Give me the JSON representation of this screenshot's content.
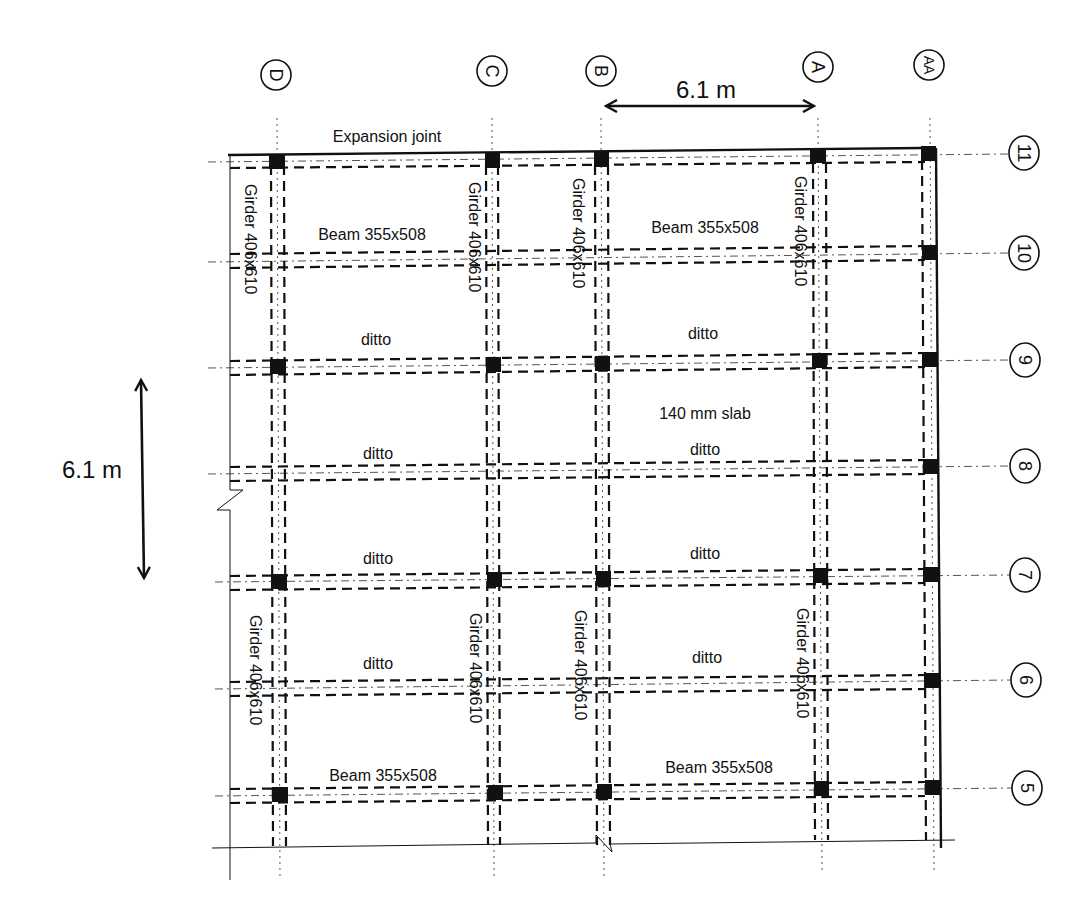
{
  "diagram": {
    "type": "structural-floor-framing-plan",
    "column_grid_labels": [
      "D",
      "C",
      "B",
      "A",
      "AA"
    ],
    "row_grid_labels": [
      "11",
      "10",
      "9",
      "8",
      "7",
      "6",
      "5"
    ],
    "columns": [
      {
        "label": "D",
        "x": 277
      },
      {
        "label": "C",
        "x": 492
      },
      {
        "label": "B",
        "x": 601
      },
      {
        "label": "A",
        "x": 818
      },
      {
        "label": "AA",
        "x": 930
      }
    ],
    "rows": [
      {
        "label": "11",
        "y": 157
      },
      {
        "label": "10",
        "y": 256
      },
      {
        "label": "9",
        "y": 363
      },
      {
        "label": "8",
        "y": 469
      },
      {
        "label": "7",
        "y": 578
      },
      {
        "label": "6",
        "y": 685
      },
      {
        "label": "5",
        "y": 792
      }
    ],
    "dimensions": {
      "horizontal": "6.1 m",
      "vertical": "6.1 m"
    },
    "labels": {
      "expansion_joint": "Expansion joint",
      "slab": "140 mm slab",
      "beam_top_left": "Beam 355x508",
      "beam_top_right": "Beam 355x508",
      "beam_bottom_left": "Beam 355x508",
      "beam_bottom_right": "Beam 355x508",
      "ditto_1": "ditto",
      "ditto_2": "ditto",
      "ditto_3": "ditto",
      "ditto_4": "ditto",
      "ditto_5": "ditto",
      "ditto_6": "ditto",
      "ditto_7": "ditto",
      "ditto_8": "ditto",
      "girder_upper_D": "Girder 406x610",
      "girder_upper_C": "Girder 406x610",
      "girder_upper_B": "Girder 406x610",
      "girder_upper_A": "Girder 406x610",
      "girder_lower_D": "Girder 406x610",
      "girder_lower_C": "Girder 406x610",
      "girder_lower_B": "Girder 406x610",
      "girder_lower_A": "Girder 406x610"
    }
  }
}
